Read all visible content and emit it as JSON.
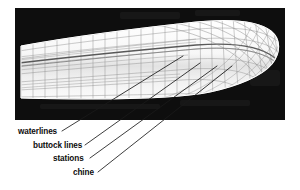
{
  "figure": {
    "background_color": "#ffffff",
    "panel_color": "#0a0a0a",
    "hull_color": "#f4f4f4",
    "grid_color": "#8e8e8e",
    "leader_color": "#1a1a1a"
  },
  "annotations": [
    {
      "id": "waterlines",
      "label": "waterlines",
      "text_x": 18,
      "text_y": 134,
      "leader_start_x": 62,
      "leader_start_y": 131,
      "leader_end_x": 183,
      "leader_end_y": 56
    },
    {
      "id": "buttock-lines",
      "label": "buttock lines",
      "text_x": 33,
      "text_y": 148,
      "leader_start_x": 85,
      "leader_start_y": 145,
      "leader_end_x": 200,
      "leader_end_y": 63
    },
    {
      "id": "stations",
      "label": "stations",
      "text_x": 53,
      "text_y": 161,
      "leader_start_x": 90,
      "leader_start_y": 158,
      "leader_end_x": 217,
      "leader_end_y": 66
    },
    {
      "id": "chine",
      "label": "chine",
      "text_x": 73,
      "text_y": 175,
      "leader_start_x": 98,
      "leader_start_y": 172,
      "leader_end_x": 232,
      "leader_end_y": 66
    }
  ],
  "panel": {
    "x": 15,
    "y": 8,
    "width": 270,
    "height": 112
  },
  "hull": {
    "stern_x": 21,
    "bow_x": 281,
    "sheer_stern_y": 46,
    "sheer_bow_y": 22,
    "keel_stern_y": 98,
    "station_count": 22,
    "waterline_count": 7
  }
}
